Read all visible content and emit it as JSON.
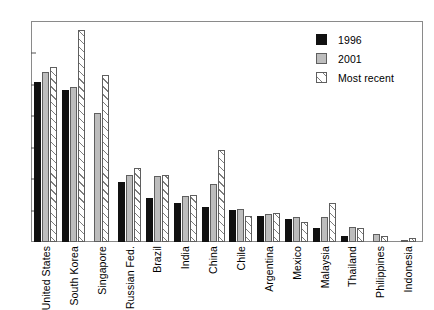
{
  "chart_data": {
    "type": "bar",
    "title": "",
    "xlabel": "",
    "ylabel": "",
    "ylim": [
      0,
      3.5
    ],
    "yticks": [
      "0.0",
      "0.5",
      "1.0",
      "1.5",
      "2.0",
      "2.5",
      "3.0",
      "3.5"
    ],
    "grid": false,
    "legend_position": "top-right",
    "categories": [
      "United States",
      "South Korea",
      "Singapore",
      "Russian Fed.",
      "Brazil",
      "India",
      "China",
      "Chile",
      "Argentina",
      "Mexico",
      "Malaysia",
      "Thailand",
      "Philippines",
      "Indonesia"
    ],
    "series": [
      {
        "name": "1996",
        "values": [
          2.54,
          2.42,
          0,
          0.95,
          0.7,
          0.62,
          0.55,
          0.51,
          0.42,
          0.37,
          0.22,
          0.1,
          0,
          0
        ]
      },
      {
        "name": "2001",
        "values": [
          2.7,
          2.47,
          2.05,
          1.07,
          1.05,
          0.73,
          0.92,
          0.52,
          0.45,
          0.4,
          0.4,
          0.24,
          0.12,
          0.04
        ]
      },
      {
        "name": "Most recent",
        "values": [
          2.79,
          3.37,
          2.65,
          1.18,
          1.07,
          0.75,
          1.47,
          0.42,
          0.46,
          0.32,
          0.62,
          0.22,
          0.1,
          0.07
        ]
      }
    ]
  },
  "legend": {
    "items": [
      {
        "label": "1996",
        "swatch": "solid-black-swatch",
        "color": "#111111"
      },
      {
        "label": "2001",
        "swatch": "solid-gray-swatch",
        "color": "#bdbdbd"
      },
      {
        "label": "Most recent",
        "swatch": "hatched-swatch",
        "color": "#ffffff"
      }
    ]
  }
}
